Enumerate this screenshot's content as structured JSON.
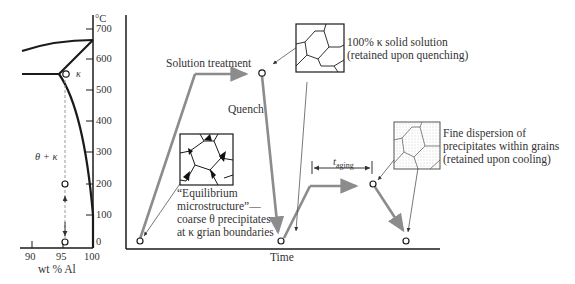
{
  "figure": {
    "phase_diagram": {
      "y_unit": "°C",
      "y_ticks": [
        "700",
        "600",
        "500",
        "400",
        "300",
        "200",
        "100",
        "0"
      ],
      "x_ticks": [
        "90",
        "95",
        "100"
      ],
      "x_label": "wt % Al",
      "phase_kappa": "κ",
      "phase_theta_kappa": "θ + κ"
    },
    "heat_treatment": {
      "x_label": "Time",
      "solution_treatment": "Solution treatment",
      "quench": "Quench",
      "aging_label_main": "t",
      "aging_label_sub": "aging",
      "annotation_solid_solution": [
        "100% κ solid solution",
        "(retained upon quenching)"
      ],
      "annotation_equilibrium": [
        "“Equilibrium",
        "microstructure”—",
        "coarse θ precipitates",
        "at κ grian boundaries"
      ],
      "annotation_fine": [
        "Fine dispersion of",
        "precipitates within grains",
        "(retained upon cooling)"
      ]
    },
    "colors": {
      "path": "#8c8c8c",
      "line": "#1a1a1a",
      "leader": "#555555"
    }
  }
}
